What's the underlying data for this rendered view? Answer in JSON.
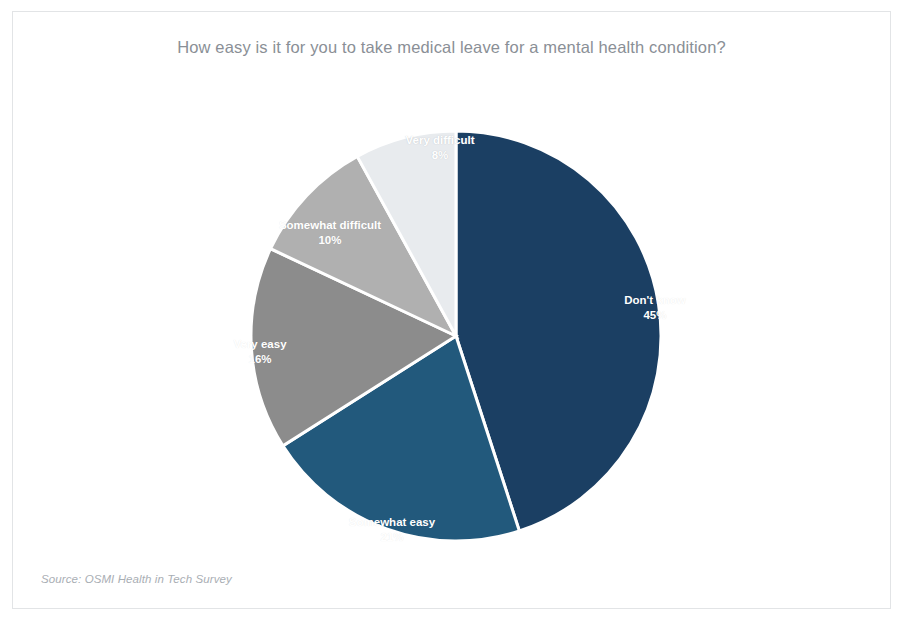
{
  "chart_data": {
    "type": "pie",
    "title": "How easy is it for you to take medical leave for a mental health condition?",
    "source": "Source: OSMI Health in Tech Survey",
    "categories": [
      "Don't know",
      "Somewhat easy",
      "Very easy",
      "Somewhat difficult",
      "Very difficult"
    ],
    "values": [
      45,
      21,
      16,
      10,
      8
    ],
    "value_suffix": "%",
    "labels": [
      "45%",
      "21%",
      "16%",
      "10%",
      "8%"
    ],
    "colors": [
      "#1b3f63",
      "#22597c",
      "#8c8c8c",
      "#b0b0b0",
      "#e8ebee"
    ],
    "start_angle_deg": 0,
    "direction": "clockwise",
    "legend": "none",
    "labels_position": "inside-slices",
    "slice_separator_color": "#ffffff",
    "background": "#ffffff",
    "title_color": "#8a8f96",
    "slices": [
      {
        "label": "Don't know",
        "pct": "45%",
        "value": 45,
        "color": "#1b3f63",
        "label_x": 642,
        "label_y": 296,
        "light": false
      },
      {
        "label": "Somewhat easy",
        "pct": "21%",
        "value": 21,
        "color": "#22597c",
        "label_x": 379,
        "label_y": 518,
        "light": false
      },
      {
        "label": "Very easy",
        "pct": "16%",
        "value": 16,
        "color": "#8c8c8c",
        "label_x": 247,
        "label_y": 340,
        "light": false
      },
      {
        "label": "Somewhat difficult",
        "pct": "10%",
        "value": 10,
        "color": "#b0b0b0",
        "label_x": 317,
        "label_y": 221,
        "light": false
      },
      {
        "label": "Very difficult",
        "pct": "8%",
        "value": 8,
        "color": "#e8ebee",
        "label_x": 427,
        "label_y": 136,
        "light": true
      }
    ]
  }
}
